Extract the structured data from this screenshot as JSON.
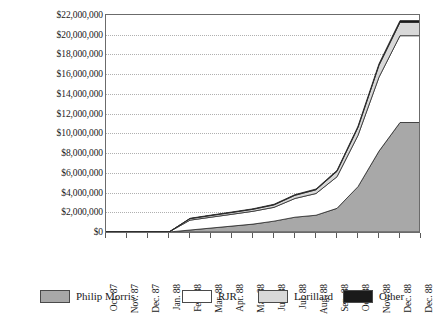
{
  "chart_data": {
    "type": "area",
    "stacked": true,
    "title": "",
    "xlabel": "",
    "ylabel": "",
    "ylim": [
      0,
      22000000
    ],
    "ytick_step": 2000000,
    "grid": true,
    "legend_position": "bottom",
    "y_tick_labels": [
      "$22,000,000",
      "$20,000,000",
      "$18,000,000",
      "$16,000,000",
      "$14,000,000",
      "$12,000,000",
      "$10,000,000",
      "$8,000,000",
      "$6,000,000",
      "$4,000,000",
      "$2,000,000",
      "$0"
    ],
    "y_tick_values": [
      22000000,
      20000000,
      18000000,
      16000000,
      14000000,
      12000000,
      10000000,
      8000000,
      6000000,
      4000000,
      2000000,
      0
    ],
    "categories": [
      "Oct. 87",
      "Nov. 87",
      "Dec. 87",
      "Jan. 88",
      "Feb. 88",
      "Mar. 88",
      "Apr. 88",
      "May 88",
      "Jun. 88",
      "Jul. 88",
      "Aug. 88",
      "Sep. 88",
      "Oct. 88",
      "Nov. 88",
      "Dec. 88",
      "Dec. 88"
    ],
    "series": [
      {
        "name": "Philip Morris",
        "color": "#a8a8a8",
        "values": [
          0,
          0,
          0,
          0,
          200000,
          400000,
          600000,
          800000,
          1100000,
          1500000,
          1700000,
          2400000,
          4600000,
          8200000,
          11100000,
          11100000
        ]
      },
      {
        "name": "RJR",
        "color": "#ffffff",
        "values": [
          0,
          0,
          0,
          0,
          1000000,
          1100000,
          1200000,
          1300000,
          1400000,
          1900000,
          2200000,
          3200000,
          5200000,
          7500000,
          8800000,
          8800000
        ]
      },
      {
        "name": "Lorillard",
        "color": "#d8d8d8",
        "values": [
          0,
          0,
          0,
          0,
          150000,
          170000,
          180000,
          200000,
          250000,
          320000,
          380000,
          550000,
          800000,
          1200000,
          1350000,
          1350000
        ]
      },
      {
        "name": "Other",
        "color": "#1a1a1a",
        "values": [
          0,
          0,
          0,
          0,
          40000,
          45000,
          50000,
          55000,
          60000,
          70000,
          80000,
          100000,
          130000,
          160000,
          180000,
          180000
        ]
      }
    ],
    "totals": [
      0,
      0,
      0,
      0,
      1390000,
      1715000,
      2030000,
      2355000,
      2810000,
      3790000,
      4360000,
      6250000,
      10730000,
      17060000,
      21430000,
      21430000
    ]
  },
  "legend": {
    "items": [
      {
        "label": "Philip Morris",
        "color": "#a8a8a8"
      },
      {
        "label": "RJR",
        "color": "#ffffff"
      },
      {
        "label": "Lorillard",
        "color": "#d8d8d8"
      },
      {
        "label": "Other",
        "color": "#1a1a1a"
      }
    ]
  }
}
